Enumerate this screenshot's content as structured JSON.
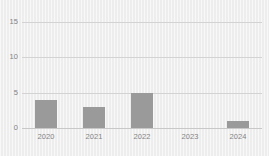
{
  "chart_data": {
    "type": "bar",
    "title": "",
    "subtitle": "",
    "xlabel": "",
    "ylabel": "",
    "categories": [
      "2020",
      "2021",
      "2022",
      "2023",
      "2024"
    ],
    "values": [
      4,
      3,
      5,
      0,
      1
    ],
    "series": [
      {
        "name": "",
        "values": [
          4,
          3,
          5,
          0,
          1
        ]
      }
    ],
    "ylim": [
      0,
      15
    ],
    "yticks": [
      "0",
      "5",
      "10",
      "15"
    ],
    "ytick_values": [
      0,
      5,
      10,
      15
    ],
    "grid": true,
    "legend": false,
    "legend_position": "none",
    "annotations": [],
    "colors": {
      "bar": "#9b9a9a",
      "gridline": "#d4d3d3",
      "axis": "#c9c8c8",
      "tick_label": "#838383",
      "background": "#f1f0f0"
    }
  }
}
